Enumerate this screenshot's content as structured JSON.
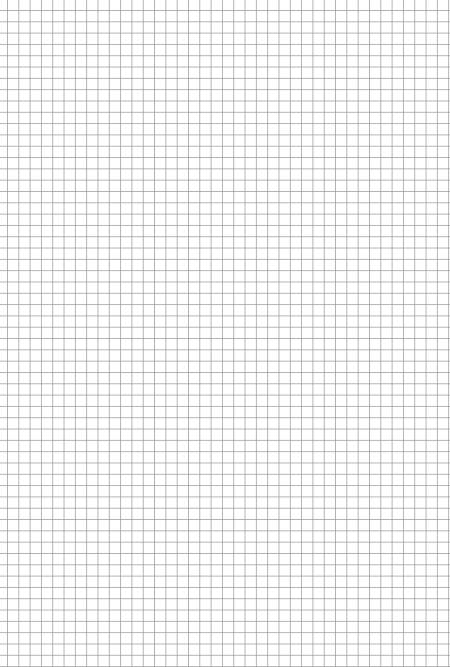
{
  "sheet": {
    "kind": "graph-paper",
    "background_color": "#ffffff",
    "grid_color": "#a8a8a8",
    "grid_spacing_px": 11.32,
    "columns": 40,
    "rows": 59
  }
}
